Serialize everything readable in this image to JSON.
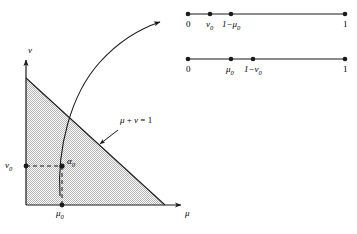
{
  "figure": {
    "colors": {
      "stroke": "#1a1a1a",
      "fill_light": "#c9c9c9",
      "background": "#ffffff"
    }
  },
  "plot": {
    "axis_x_label": "μ",
    "axis_y_label": "ν",
    "tick_x_label": "μ",
    "tick_x_sub": "0",
    "tick_y_label": "ν",
    "tick_y_sub": "0",
    "point_label": "α",
    "point_sub": "0",
    "constraint_label_mu": "μ",
    "constraint_label_plus": " + ",
    "constraint_label_nu": "ν",
    "constraint_label_eq": " = 1",
    "region_description": "shaded triangle mu + nu <= 1, mu >= 0, nu >= 0"
  },
  "numberlines": [
    {
      "name": "upper-number-line",
      "ticks": [
        {
          "value": 0,
          "label": "0",
          "label_sub": "",
          "position_pct": 0
        },
        {
          "value": 0.14,
          "label": "ν",
          "label_sub": "0",
          "position_pct": 14
        },
        {
          "value": 0.27,
          "label": "1−μ",
          "label_sub": "0",
          "position_pct": 27
        },
        {
          "value": 1,
          "label": "1",
          "label_sub": "",
          "position_pct": 100
        }
      ]
    },
    {
      "name": "lower-number-line",
      "ticks": [
        {
          "value": 0,
          "label": "0",
          "label_sub": "",
          "position_pct": 0
        },
        {
          "value": 0.27,
          "label": "μ",
          "label_sub": "0",
          "position_pct": 27
        },
        {
          "value": 0.41,
          "label": "1−ν",
          "label_sub": "0",
          "position_pct": 41
        },
        {
          "value": 1,
          "label": "1",
          "label_sub": "",
          "position_pct": 100
        }
      ]
    }
  ],
  "annotations": {
    "curved_arrow": "arrow from alpha-0 point to the number lines"
  }
}
